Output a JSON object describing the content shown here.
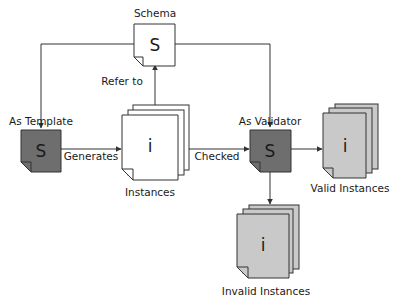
{
  "diagram": {
    "colors": {
      "schema_fill": "#ffffff",
      "template_fill": "#6e6e6e",
      "validator_fill": "#6e6e6e",
      "instances_fill": "#ffffff",
      "valid_fill": "#c9c9c9",
      "invalid_fill": "#c9c9c9",
      "stroke": "#333333"
    },
    "nodes": {
      "schema": {
        "label": "Schema",
        "glyph": "S"
      },
      "template": {
        "label": "As Template",
        "glyph": "S"
      },
      "instances": {
        "label": "Instances",
        "glyph": "i"
      },
      "validator": {
        "label": "As Validator",
        "glyph": "S"
      },
      "valid": {
        "label": "Valid Instances",
        "glyph": "i"
      },
      "invalid": {
        "label": "Invalid Instances",
        "glyph": "i"
      }
    },
    "edges": {
      "generates": "Generates",
      "refer_to": "Refer to",
      "checked": "Checked"
    }
  }
}
